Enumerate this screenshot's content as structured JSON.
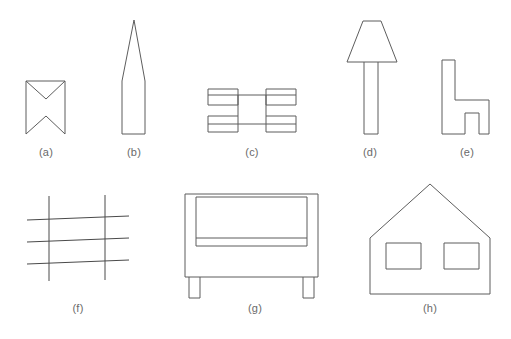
{
  "sheet": {
    "background_color": "#ffffff",
    "stroke_color": "#5d5d5d",
    "label_color": "#6a6a6a",
    "title": "Line drawings of eight outline shapes"
  },
  "figures": [
    {
      "id": "a",
      "label": "(a)",
      "name": "bowtie-notched-rectangle",
      "description": "Rectangle with V notches cut into the top and bottom edges",
      "label_x": 46,
      "label_y": 146,
      "shape_type": "polygon",
      "points": "26,81 65,81 65,134 46,116 26,134 26,81",
      "extra_points": "26,81 46,99 65,81"
    },
    {
      "id": "b",
      "label": "(b)",
      "name": "tall-spike-rocket",
      "description": "Narrow vertical rectangle topped by a very tall slender triangle",
      "label_x": 134,
      "label_y": 146,
      "shape_type": "polygon",
      "points": "122,134 122,81 134,20 145,81 145,134 122,134"
    },
    {
      "id": "c",
      "label": "(c)",
      "name": "beam-with-four-corner-boxes",
      "description": "Horizontal double-line beam with four small rectangles at the corners",
      "label_x": 252,
      "label_y": 146,
      "shape_type": "composite",
      "beam_top_y": 95,
      "beam_bottom_y": 124,
      "beam_left_x": 208,
      "beam_right_x": 296,
      "boxes": [
        {
          "x": 208,
          "y": 89,
          "w": 30,
          "h": 16
        },
        {
          "x": 266,
          "y": 89,
          "w": 30,
          "h": 16
        },
        {
          "x": 208,
          "y": 116,
          "w": 30,
          "h": 16
        },
        {
          "x": 266,
          "y": 116,
          "w": 30,
          "h": 16
        }
      ]
    },
    {
      "id": "d",
      "label": "(d)",
      "name": "table-lamp",
      "description": "Trapezoid lamp shade above a tall vertical post",
      "label_x": 370,
      "label_y": 146,
      "shape_type": "composite",
      "shade_points": "347,62 363,21 381,21 397,62 347,62",
      "post_x": 364,
      "post_y": 62,
      "post_w": 14,
      "post_h": 72
    },
    {
      "id": "e",
      "label": "(e)",
      "name": "chair-side-view",
      "description": "Chair profile with tall backrest on the left, seat, and two legs",
      "label_x": 467,
      "label_y": 146,
      "shape_type": "polygon",
      "points": "442,60 455,60 455,100 489,100 489,134 479,134 479,113 465,113 465,134 442,134 442,60"
    },
    {
      "id": "f",
      "label": "(f)",
      "name": "grid-of-lines",
      "description": "Two vertical lines crossed by three slightly slanted horizontal lines",
      "label_x": 78,
      "label_y": 302,
      "shape_type": "lines",
      "vertical_lines": [
        {
          "x1": 49,
          "y1": 196,
          "x2": 49,
          "y2": 281
        },
        {
          "x1": 105,
          "y1": 195,
          "x2": 105,
          "y2": 280
        }
      ],
      "horizontal_lines": [
        {
          "x1": 27,
          "y1": 220,
          "x2": 129,
          "y2": 216
        },
        {
          "x1": 27,
          "y1": 242,
          "x2": 129,
          "y2": 238
        },
        {
          "x1": 27,
          "y1": 264,
          "x2": 129,
          "y2": 260
        }
      ]
    },
    {
      "id": "g",
      "label": "(g)",
      "name": "armchair-sofa-front-view",
      "description": "Sofa front view: outer frame, inner backrest panel, seat line and two legs",
      "label_x": 255,
      "label_y": 302,
      "shape_type": "composite",
      "body": {
        "x": 185,
        "y": 194,
        "w": 133,
        "h": 83
      },
      "backrest": {
        "x": 196,
        "y": 197,
        "w": 111,
        "h": 49
      },
      "seat_line_y": 238,
      "seat_line_x1": 196,
      "seat_line_x2": 307,
      "legs": [
        {
          "x": 189,
          "y": 277,
          "w": 11,
          "h": 21
        },
        {
          "x": 303,
          "y": 277,
          "w": 11,
          "h": 21
        }
      ]
    },
    {
      "id": "h",
      "label": "(h)",
      "name": "house-with-two-windows",
      "description": "House outline with pitched roof and two rectangular windows",
      "label_x": 430,
      "label_y": 302,
      "shape_type": "composite",
      "outline_points": "370,294 370,238 430,184 490,238 490,294 370,294",
      "windows": [
        {
          "x": 386,
          "y": 243,
          "w": 35,
          "h": 26
        },
        {
          "x": 444,
          "y": 243,
          "w": 35,
          "h": 26
        }
      ]
    }
  ]
}
